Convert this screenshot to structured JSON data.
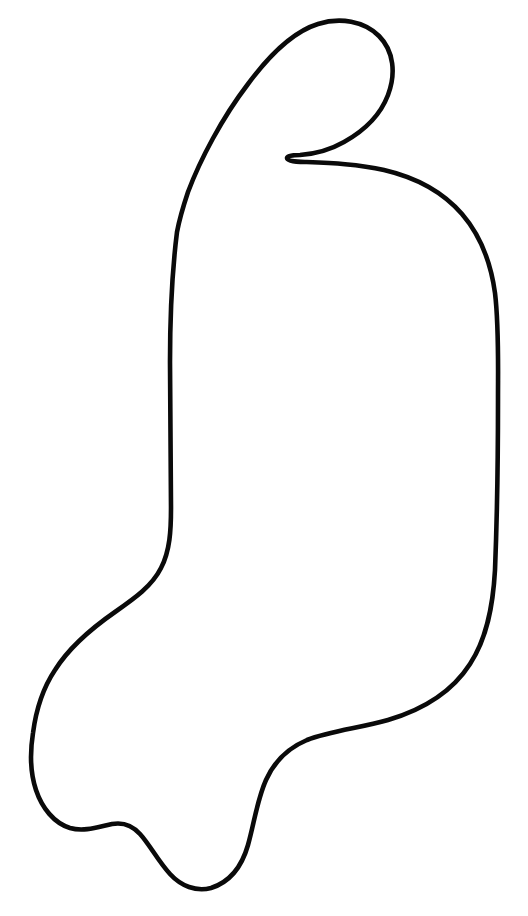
{
  "canvas": {
    "width": 528,
    "height": 916,
    "background_color": "#ffffff",
    "title": "hand-drawn-outline"
  },
  "drawing": {
    "name": "closed-contour-outline",
    "description": "Single closed hand-drawn contour resembling a mitten or sock silhouette with a pointed hook at the top",
    "stroke_color": "#0a0a0a",
    "stroke_width": 4.6,
    "fill": "none",
    "viewbox": "0 0 528 916",
    "path": "M 188 192 C 200 160 222 118 248 84 C 268 57 292 32 318 24 C 340 17 364 21 379 36 C 394 51 396 74 388 95 C 380 116 362 132 344 142 C 330 150 314 154 300 155 C 292 155 287 156 287 158 C 287 161 294 162 305 162 C 330 163 358 164 384 170 C 414 177 442 191 462 214 C 481 236 491 264 495 293 C 499 326 498 362 498 400 C 498 460 497 520 495 570 C 493 606 487 638 470 664 C 452 692 422 710 388 720 C 360 728 330 731 307 740 C 288 748 274 762 266 780 C 257 800 254 824 248 845 C 242 866 230 882 211 888 C 196 892 181 886 170 874 C 158 861 150 845 140 834 C 132 825 123 822 112 824 C 98 827 84 832 70 828 C 54 823 42 808 36 790 C 30 772 30 752 33 733 C 36 710 43 688 55 670 C 70 646 92 628 115 612 C 135 598 152 586 161 568 C 170 551 171 530 171 508 C 171 460 170 410 170 362 C 170 318 172 272 177 232 C 180 216 184 204 188 192 Z"
  }
}
